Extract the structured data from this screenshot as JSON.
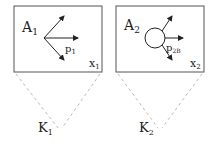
{
  "colors": {
    "stroke": "#222222",
    "dashed": "#bbbbbb",
    "box_border": "#555555"
  },
  "panels": [
    {
      "label": "A",
      "label_sub": "1",
      "momentum": "p",
      "momentum_sub": "1",
      "corner": "x",
      "corner_sub": "1",
      "vertex": "K",
      "vertex_sub": "1",
      "has_blob": false
    },
    {
      "label": "A",
      "label_sub": "2",
      "momentum": "p",
      "momentum_sub": "2B",
      "corner": "x",
      "corner_sub": "2",
      "vertex": "K",
      "vertex_sub": "2",
      "has_blob": true
    }
  ]
}
